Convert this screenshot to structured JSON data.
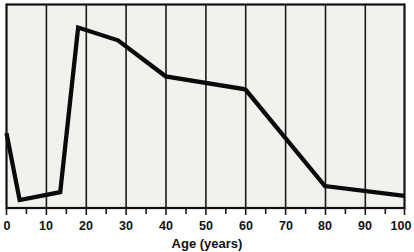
{
  "chart_data": {
    "type": "line",
    "title": "",
    "xlabel": "Age (years)",
    "ylabel": "",
    "xlim": [
      0,
      100
    ],
    "ylim": [
      0,
      100
    ],
    "grid": true,
    "legend": "none",
    "xticks": [
      0,
      10,
      20,
      30,
      40,
      50,
      60,
      70,
      80,
      90,
      100
    ],
    "xtick_labels": [
      "0",
      "10",
      "20",
      "30",
      "40",
      "50",
      "60",
      "70",
      "80",
      "90",
      "100"
    ],
    "yticks": [],
    "ytick_labels": [],
    "series": [
      {
        "name": "incidence",
        "x": [
          0,
          3.3,
          13.5,
          18,
          28,
          40,
          60,
          80,
          100
        ],
        "y": [
          36.8,
          3.9,
          7.8,
          88.7,
          82.4,
          64.7,
          58.3,
          10.8,
          5.9
        ]
      }
    ],
    "annotations": []
  },
  "axis": {
    "x_title": "Age (years)"
  },
  "ticks": {
    "labels": [
      "0",
      "10",
      "20",
      "30",
      "40",
      "50",
      "60",
      "70",
      "80",
      "90",
      "100"
    ]
  },
  "colors": {
    "plot_background": "#f2f1ee",
    "line": "#0a0a0a",
    "grid": "#1a1a1a",
    "frame": "#111111",
    "text": "#111111",
    "page_background": "#ffffff"
  }
}
